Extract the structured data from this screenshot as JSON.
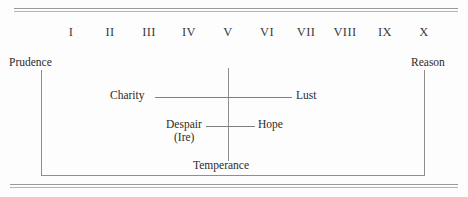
{
  "figure": {
    "type": "scale-diagram",
    "background_color": "#fdfdfd",
    "line_color": "#8e8e8e",
    "text_color": "#2b2b2b"
  },
  "scale": {
    "label": "degree-scale",
    "numerals": [
      {
        "value": "I",
        "x": 71
      },
      {
        "value": "II",
        "x": 110
      },
      {
        "value": "III",
        "x": 149
      },
      {
        "value": "IV",
        "x": 189
      },
      {
        "value": "V",
        "x": 228
      },
      {
        "value": "VI",
        "x": 267
      },
      {
        "value": "VII",
        "x": 306
      },
      {
        "value": "VIII",
        "x": 345
      },
      {
        "value": "IX",
        "x": 385
      },
      {
        "value": "X",
        "x": 424
      }
    ]
  },
  "endpoints": {
    "left": "Prudence",
    "right": "Reason"
  },
  "pairs": [
    {
      "left": "Charity",
      "right": "Lust"
    },
    {
      "left": "Despair",
      "left_sub": "(Ire)",
      "right": "Hope"
    }
  ],
  "center_label": "Temperance"
}
